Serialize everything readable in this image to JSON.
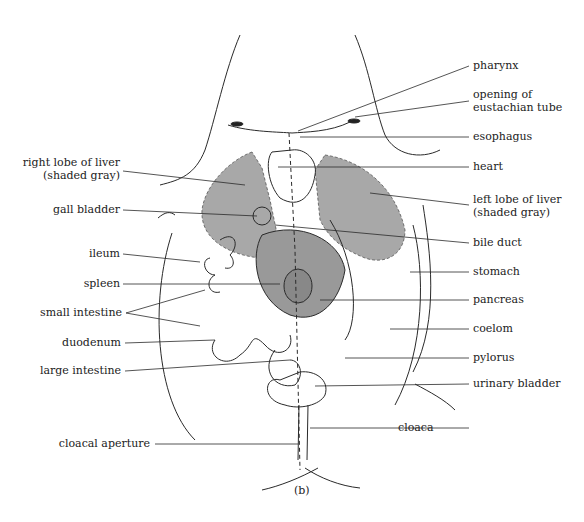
{
  "figure": {
    "caption": "(b)",
    "liver_fill": "#a8a8a8",
    "line_color": "#2a2a2a"
  },
  "labels_left": [
    {
      "id": "right-lobe-of-liver",
      "line1": "right lobe of liver",
      "line2": "(shaded gray)"
    },
    {
      "id": "gall-bladder",
      "line1": "gall bladder"
    },
    {
      "id": "ileum",
      "line1": "ileum"
    },
    {
      "id": "spleen",
      "line1": "spleen"
    },
    {
      "id": "small-intestine",
      "line1": "small intestine"
    },
    {
      "id": "duodenum",
      "line1": "duodenum"
    },
    {
      "id": "large-intestine",
      "line1": "large intestine"
    },
    {
      "id": "cloacal-aperture",
      "line1": "cloacal aperture"
    }
  ],
  "labels_right": [
    {
      "id": "pharynx",
      "line1": "pharynx"
    },
    {
      "id": "opening-of-eustachian-tube",
      "line1": "opening of",
      "line2": "eustachian tube"
    },
    {
      "id": "esophagus",
      "line1": "esophagus"
    },
    {
      "id": "heart",
      "line1": "heart"
    },
    {
      "id": "left-lobe-of-liver",
      "line1": "left lobe of liver",
      "line2": "(shaded gray)"
    },
    {
      "id": "bile-duct",
      "line1": "bile duct"
    },
    {
      "id": "stomach",
      "line1": "stomach"
    },
    {
      "id": "pancreas",
      "line1": "pancreas"
    },
    {
      "id": "coelom",
      "line1": "coelom"
    },
    {
      "id": "pylorus",
      "line1": "pylorus"
    },
    {
      "id": "urinary-bladder",
      "line1": "urinary bladder"
    },
    {
      "id": "cloaca",
      "line1": "cloaca"
    }
  ]
}
